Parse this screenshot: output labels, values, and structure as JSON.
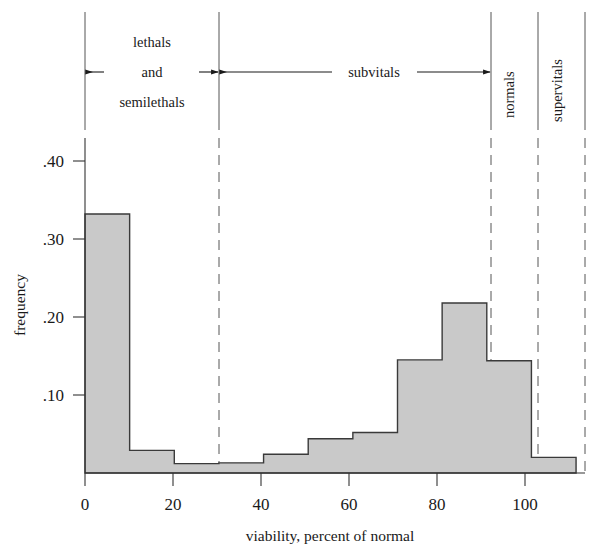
{
  "chart_data": {
    "type": "bar",
    "title": "",
    "xlabel": "viability, percent of normal",
    "ylabel": "frequency",
    "xlim": [
      0,
      112
    ],
    "ylim": [
      0,
      0.44
    ],
    "grid": false,
    "legend_position": "none",
    "bin_width": 10,
    "bin_edges": [
      0,
      10,
      20,
      30,
      40,
      50,
      60,
      70,
      80,
      90,
      100,
      110
    ],
    "categories": [
      "0-10",
      "10-20",
      "20-30",
      "30-40",
      "40-50",
      "50-60",
      "60-70",
      "70-80",
      "80-90",
      "90-100",
      "100-110"
    ],
    "values": [
      0.332,
      0.029,
      0.012,
      0.013,
      0.024,
      0.044,
      0.052,
      0.145,
      0.218,
      0.144,
      0.02
    ],
    "xticks": [
      0,
      20,
      40,
      60,
      80,
      100
    ],
    "xtick_labels": [
      "0",
      "20",
      "40",
      "60",
      "80",
      "100"
    ],
    "yticks": [
      0.1,
      0.2,
      0.3,
      0.4
    ],
    "ytick_labels": [
      ".10",
      ".20",
      ".30",
      ".40"
    ],
    "annotations": [
      {
        "label": "lethals\nand\nsemilethals",
        "range": [
          0,
          30
        ],
        "style": "arrow-both"
      },
      {
        "label": "subvitals",
        "range": [
          30,
          90
        ],
        "style": "arrow-both"
      },
      {
        "label": "normals",
        "range": [
          90,
          100
        ],
        "style": "vertical-text"
      },
      {
        "label": "supervitals",
        "range": [
          100,
          112
        ],
        "style": "vertical-text"
      }
    ],
    "bar_fill_color": "#c9c9c9",
    "bar_edge_color": "#3a3a3a",
    "divider_color": "#555555"
  },
  "axes": {
    "y_ticks": [
      {
        "label": ".40",
        "value": 0.4
      },
      {
        "label": ".30",
        "value": 0.3
      },
      {
        "label": ".20",
        "value": 0.2
      },
      {
        "label": ".10",
        "value": 0.1
      }
    ],
    "x_ticks": [
      {
        "label": "0",
        "value": 0
      },
      {
        "label": "20",
        "value": 20
      },
      {
        "label": "40",
        "value": 40
      },
      {
        "label": "60",
        "value": 60
      },
      {
        "label": "80",
        "value": 80
      },
      {
        "label": "100",
        "value": 100
      }
    ],
    "y_axis_title": "frequency",
    "x_axis_title": "viability, percent of normal"
  },
  "regions": {
    "lethals_line1": "lethals",
    "lethals_line2": "and",
    "lethals_line3": "semilethals",
    "subvitals": "subvitals",
    "normals": "normals",
    "supervitals": "supervitals"
  }
}
